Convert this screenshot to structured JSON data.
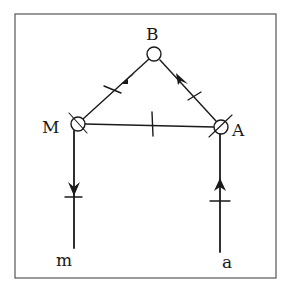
{
  "diagram": {
    "nodes": [
      {
        "id": "B",
        "label": "B"
      },
      {
        "id": "M",
        "label": "M"
      },
      {
        "id": "A",
        "label": "A"
      }
    ],
    "terminals": [
      {
        "id": "m",
        "label": "m"
      },
      {
        "id": "a",
        "label": "a"
      }
    ],
    "edges": [
      {
        "from": "B",
        "to": "M",
        "arrow": "toward M",
        "tick": true
      },
      {
        "from": "A",
        "to": "B",
        "arrow": "toward B",
        "tick": true
      },
      {
        "from": "M",
        "to": "A",
        "arrow": "none",
        "tick": true
      },
      {
        "from": "M",
        "to": "m",
        "arrow": "down",
        "tick": true
      },
      {
        "from": "a",
        "to": "A",
        "arrow": "up",
        "tick": true
      }
    ],
    "colors": {
      "ink": "#1a1a1a",
      "background": "#ffffff",
      "frame": "#555555"
    }
  }
}
